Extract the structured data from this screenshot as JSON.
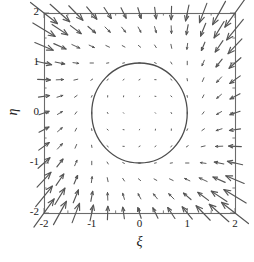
{
  "figure": {
    "kind": "quiver-vector-field",
    "background": "#ffffff",
    "line_color": "#4d4d4d",
    "arrow_color": "#555555",
    "axis_color": "#6b6b6b",
    "box": {
      "left": 44,
      "top": 13,
      "right": 235,
      "bottom": 213
    }
  },
  "axes": {
    "x": {
      "label": "ξ",
      "min": -2,
      "max": 2,
      "ticks": [
        -2,
        -1,
        0,
        1,
        2
      ],
      "tick_labels": [
        "-2",
        "-1",
        "0",
        "1",
        "2"
      ],
      "minor_tick_step": 0.5
    },
    "y": {
      "label": "η",
      "min": -2,
      "max": 2,
      "ticks": [
        -2,
        -1,
        0,
        1,
        2
      ],
      "tick_labels": [
        "-2",
        "-1",
        "0",
        "1",
        "2"
      ],
      "minor_tick_step": 0.5
    }
  },
  "chart_data": {
    "type": "scatter",
    "title": "",
    "xlabel": "ξ",
    "ylabel": "η",
    "xlim": [
      -2,
      2
    ],
    "ylim": [
      -2,
      2
    ],
    "grid": false,
    "legend": null,
    "series": [
      {
        "name": "vector field",
        "type": "quiver",
        "grid_nx": 13,
        "grid_ny": 13,
        "grid_step": 0.3333,
        "arrow_scale": 0.3,
        "head_length_frac": 0.34,
        "head_angle_deg": 22,
        "formula_u": "eta + xi*(1 - xi*xi - eta*eta)",
        "formula_v": "-xi + eta*(1 - xi*xi - eta*eta)",
        "color": "#555555"
      },
      {
        "name": "limit cycle",
        "type": "circle",
        "center": [
          0,
          0
        ],
        "radius": 1,
        "color": "#4d4d4d",
        "linewidth": 1.3
      }
    ]
  }
}
